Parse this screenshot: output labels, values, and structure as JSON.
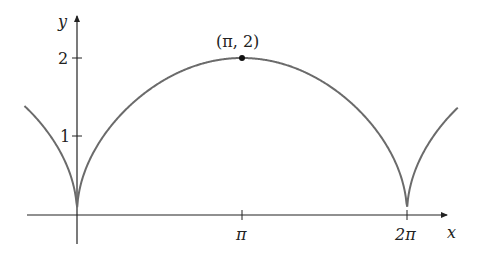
{
  "chart_data": {
    "type": "line",
    "title": "",
    "xlabel": "x",
    "ylabel": "y",
    "function": "y = 2*sqrt(|sin(x/2)|)",
    "xlim": [
      -1.0,
      7.25
    ],
    "ylim": [
      0,
      2.0
    ],
    "x_ticks": [
      {
        "value": 3.14159,
        "label": "π"
      },
      {
        "value": 6.28319,
        "label": "2π"
      }
    ],
    "y_ticks": [
      {
        "value": 1,
        "label": "1"
      },
      {
        "value": 2,
        "label": "2"
      }
    ],
    "annotations": [
      {
        "type": "point",
        "x": 3.14159,
        "y": 2,
        "label": "(π, 2)"
      }
    ],
    "series": [
      {
        "name": "curve",
        "color": "#6b6b6b",
        "x": [
          -1.0,
          -0.5,
          -0.1,
          0,
          0.1,
          0.5,
          1.0,
          1.57,
          2.0,
          2.5,
          3.14,
          3.78,
          4.28,
          4.71,
          5.28,
          5.78,
          6.18,
          6.28,
          6.38,
          6.78,
          7.25
        ],
        "y": [
          1.38,
          0.99,
          0.45,
          0,
          0.45,
          0.99,
          1.38,
          1.68,
          1.83,
          1.95,
          2.0,
          1.95,
          1.83,
          1.68,
          1.38,
          0.99,
          0.45,
          0,
          0.45,
          0.99,
          1.38
        ]
      }
    ],
    "grid": false,
    "legend": null
  },
  "labels": {
    "x_axis": "x",
    "y_axis": "y",
    "tick_pi": "π",
    "tick_2pi": "2π",
    "tick_y1": "1",
    "tick_y2": "2",
    "point": "(π, 2)"
  },
  "colors": {
    "curve": "#6b6b6b",
    "axis": "#222222",
    "point": "#111111"
  }
}
